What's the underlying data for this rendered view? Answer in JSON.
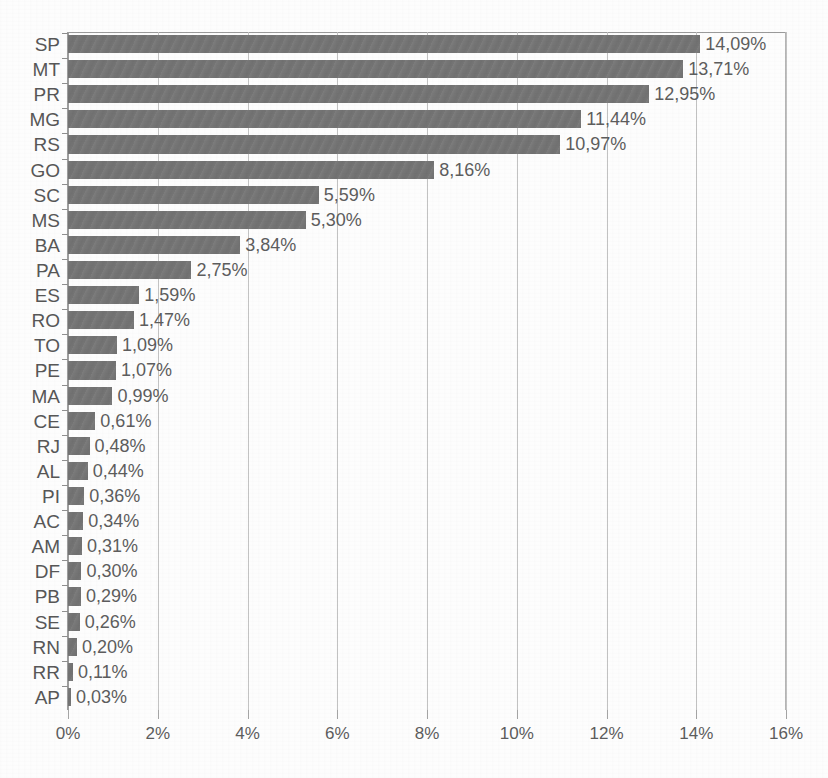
{
  "chart_data": {
    "type": "bar",
    "orientation": "horizontal",
    "title": "",
    "xlabel": "",
    "ylabel": "",
    "xlim": [
      0,
      16
    ],
    "xtick_labels": [
      "0%",
      "2%",
      "4%",
      "6%",
      "8%",
      "10%",
      "12%",
      "14%",
      "16%"
    ],
    "xtick_values": [
      0,
      2,
      4,
      6,
      8,
      10,
      12,
      14,
      16
    ],
    "grid": true,
    "legend": "none",
    "bar_color": "#757575",
    "decimal_separator": ",",
    "categories": [
      "SP",
      "MT",
      "PR",
      "MG",
      "RS",
      "GO",
      "SC",
      "MS",
      "BA",
      "PA",
      "ES",
      "RO",
      "TO",
      "PE",
      "MA",
      "CE",
      "RJ",
      "AL",
      "PI",
      "AC",
      "AM",
      "DF",
      "PB",
      "SE",
      "RN",
      "RR",
      "AP"
    ],
    "values": [
      14.09,
      13.71,
      12.95,
      11.44,
      10.97,
      8.16,
      5.59,
      5.3,
      3.84,
      2.75,
      1.59,
      1.47,
      1.09,
      1.07,
      0.99,
      0.61,
      0.48,
      0.44,
      0.36,
      0.34,
      0.31,
      0.3,
      0.29,
      0.26,
      0.2,
      0.11,
      0.03
    ],
    "value_labels": [
      "14,09%",
      "13,71%",
      "12,95%",
      "11,44%",
      "10,97%",
      "8,16%",
      "5,59%",
      "5,30%",
      "3,84%",
      "2,75%",
      "1,59%",
      "1,47%",
      "1,09%",
      "1,07%",
      "0,99%",
      "0,61%",
      "0,48%",
      "0,44%",
      "0,36%",
      "0,34%",
      "0,31%",
      "0,30%",
      "0,29%",
      "0,26%",
      "0,20%",
      "0,11%",
      "0,03%"
    ]
  }
}
